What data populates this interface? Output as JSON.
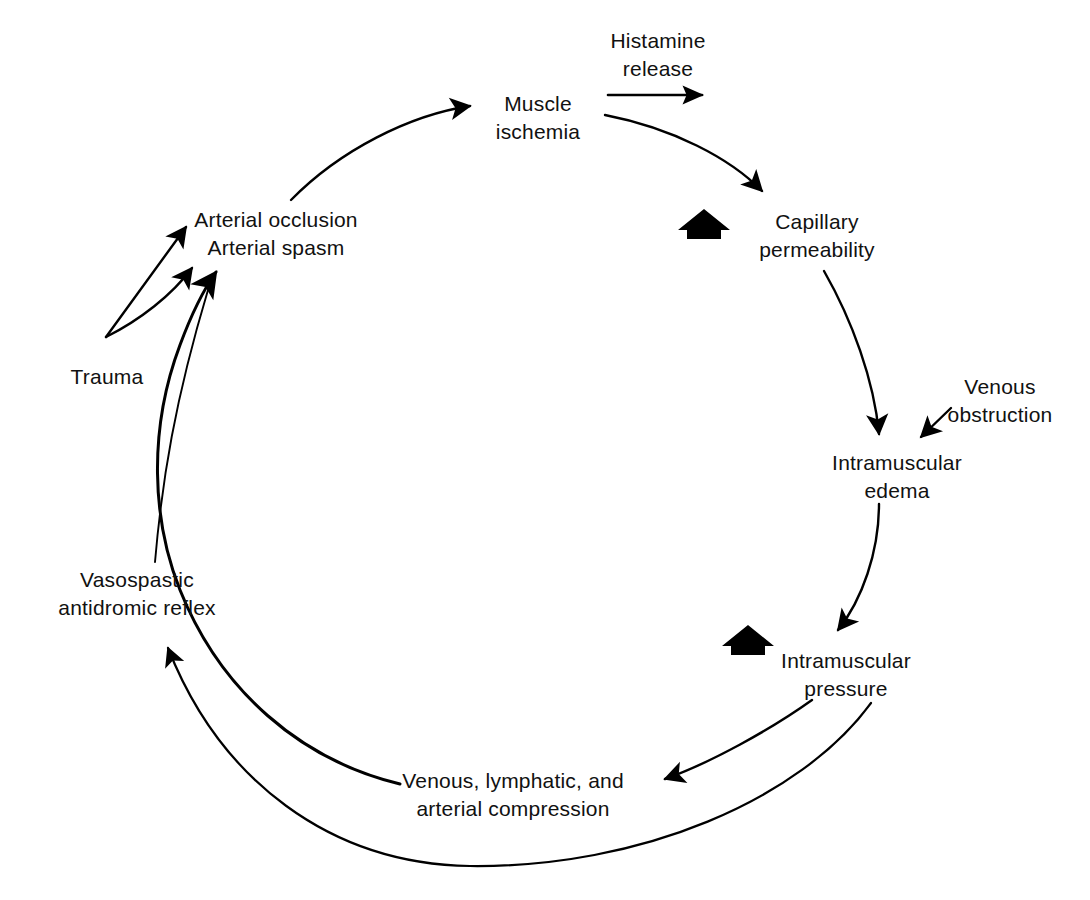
{
  "diagram": {
    "type": "cycle-flow-diagram",
    "background_color": "#ffffff",
    "stroke_color": "#000000",
    "nodes": [
      {
        "id": "muscle-ischemia",
        "lines": [
          "Muscle",
          "ischemia"
        ],
        "x": 538,
        "y": 118
      },
      {
        "id": "capillary-permeability",
        "lines": [
          "Capillary",
          "permeability"
        ],
        "x": 817,
        "y": 236
      },
      {
        "id": "intramuscular-edema",
        "lines": [
          "Intramuscular",
          "edema"
        ],
        "x": 897,
        "y": 477
      },
      {
        "id": "intramuscular-pressure",
        "lines": [
          "Intramuscular",
          "pressure"
        ],
        "x": 846,
        "y": 675
      },
      {
        "id": "venous-lymphatic-arterial-compression",
        "lines": [
          "Venous, lymphatic, and",
          "arterial compression"
        ],
        "x": 513,
        "y": 795
      },
      {
        "id": "vasospastic-antidromic-reflex",
        "lines": [
          "Vasospastic",
          "antidromic reflex"
        ],
        "x": 137,
        "y": 594
      },
      {
        "id": "trauma",
        "lines": [
          "Trauma"
        ],
        "x": 107,
        "y": 377
      },
      {
        "id": "arterial-occlusion-spasm",
        "lines": [
          "Arterial occlusion",
          "Arterial spasm"
        ],
        "x": 276,
        "y": 234
      },
      {
        "id": "venous-obstruction",
        "lines": [
          "Venous",
          "obstruction"
        ],
        "x": 1000,
        "y": 401
      }
    ],
    "edge_labels": [
      {
        "id": "histamine-release",
        "lines": [
          "Histamine",
          "release"
        ],
        "x": 658,
        "y": 55
      }
    ],
    "increase_markers": [
      {
        "id": "increase-capillary-permeability",
        "x": 704,
        "y": 226
      },
      {
        "id": "increase-intramuscular-pressure",
        "x": 748,
        "y": 642
      }
    ],
    "edges": [
      {
        "id": "edge-arterial-to-ischemia",
        "from": "arterial-occlusion-spasm",
        "to": "muscle-ischemia",
        "arrowhead": true
      },
      {
        "id": "edge-histamine-release",
        "from": "histamine-release",
        "to": "capillary-permeability",
        "arrowhead": true
      },
      {
        "id": "edge-ischemia-to-capillary",
        "from": "muscle-ischemia",
        "to": "capillary-permeability",
        "arrowhead": true
      },
      {
        "id": "edge-capillary-to-edema",
        "from": "capillary-permeability",
        "to": "intramuscular-edema",
        "arrowhead": true
      },
      {
        "id": "edge-venous-obstruction-to-edema",
        "from": "venous-obstruction",
        "to": "intramuscular-edema",
        "arrowhead": true
      },
      {
        "id": "edge-edema-to-pressure",
        "from": "intramuscular-edema",
        "to": "intramuscular-pressure",
        "arrowhead": true
      },
      {
        "id": "edge-pressure-to-compression",
        "from": "intramuscular-pressure",
        "to": "venous-lymphatic-arterial-compression",
        "arrowhead": true
      },
      {
        "id": "edge-pressure-outer-to-vasospastic",
        "from": "intramuscular-pressure",
        "to": "vasospastic-antidromic-reflex",
        "arrowhead": true
      },
      {
        "id": "edge-compression-to-arterial",
        "from": "venous-lymphatic-arterial-compression",
        "to": "arterial-occlusion-spasm",
        "arrowhead": true
      },
      {
        "id": "edge-vasospastic-to-arterial",
        "from": "vasospastic-antidromic-reflex",
        "to": "arterial-occlusion-spasm",
        "arrowhead": false
      },
      {
        "id": "edge-trauma-to-occlusion",
        "from": "trauma",
        "to": "arterial-occlusion-spasm",
        "arrowhead": true
      },
      {
        "id": "edge-trauma-to-spasm",
        "from": "trauma",
        "to": "arterial-occlusion-spasm",
        "arrowhead": true
      }
    ]
  }
}
